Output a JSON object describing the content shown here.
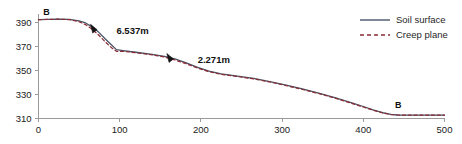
{
  "chart_data": {
    "type": "line",
    "title": "",
    "xlabel": "",
    "ylabel": "",
    "xlim": [
      0,
      500
    ],
    "ylim": [
      305,
      397
    ],
    "xticks": [
      0,
      100,
      200,
      300,
      400,
      500
    ],
    "yticks": [
      310,
      330,
      350,
      370,
      390
    ],
    "grid": false,
    "legend_position": "top-right",
    "series": [
      {
        "name": "Soil surface",
        "style": "solid",
        "color": "#4a5568",
        "points": [
          [
            0,
            392.4
          ],
          [
            12,
            392.6
          ],
          [
            25,
            392.8
          ],
          [
            38,
            392.6
          ],
          [
            50,
            391.4
          ],
          [
            58,
            389.6
          ],
          [
            66,
            386.4
          ],
          [
            74,
            382.0
          ],
          [
            82,
            376.4
          ],
          [
            90,
            371.2
          ],
          [
            96,
            367.4
          ],
          [
            104,
            366.6
          ],
          [
            120,
            365.2
          ],
          [
            140,
            363.4
          ],
          [
            155,
            361.8
          ],
          [
            168,
            359.6
          ],
          [
            182,
            356.4
          ],
          [
            196,
            352.6
          ],
          [
            210,
            349.4
          ],
          [
            225,
            347.2
          ],
          [
            245,
            345.4
          ],
          [
            265,
            343.4
          ],
          [
            285,
            340.8
          ],
          [
            305,
            337.8
          ],
          [
            325,
            334.6
          ],
          [
            345,
            331.2
          ],
          [
            365,
            327.4
          ],
          [
            385,
            323.2
          ],
          [
            400,
            320.0
          ],
          [
            412,
            317.2
          ],
          [
            424,
            314.8
          ],
          [
            434,
            313.4
          ],
          [
            442,
            312.9
          ],
          [
            460,
            312.8
          ],
          [
            480,
            312.8
          ],
          [
            500,
            312.8
          ]
        ]
      },
      {
        "name": "Creep plane",
        "style": "dashed",
        "color": "#8b2b33",
        "points": [
          [
            0,
            392.4
          ],
          [
            12,
            392.6
          ],
          [
            25,
            392.8
          ],
          [
            38,
            392.4
          ],
          [
            50,
            390.6
          ],
          [
            58,
            388.2
          ],
          [
            66,
            384.4
          ],
          [
            74,
            379.6
          ],
          [
            82,
            374.0
          ],
          [
            90,
            369.0
          ],
          [
            96,
            366.0
          ],
          [
            104,
            366.0
          ],
          [
            120,
            364.8
          ],
          [
            140,
            363.0
          ],
          [
            155,
            361.2
          ],
          [
            168,
            358.8
          ],
          [
            182,
            355.6
          ],
          [
            196,
            352.0
          ],
          [
            210,
            349.0
          ],
          [
            225,
            346.8
          ],
          [
            245,
            345.0
          ],
          [
            265,
            343.0
          ],
          [
            285,
            340.4
          ],
          [
            305,
            337.4
          ],
          [
            325,
            334.2
          ],
          [
            345,
            330.8
          ],
          [
            365,
            327.0
          ],
          [
            385,
            322.8
          ],
          [
            400,
            319.6
          ],
          [
            412,
            316.9
          ],
          [
            424,
            314.6
          ],
          [
            434,
            313.3
          ],
          [
            442,
            312.9
          ],
          [
            460,
            312.8
          ],
          [
            480,
            312.8
          ],
          [
            500,
            312.8
          ]
        ]
      }
    ],
    "annotations": [
      {
        "name": "displacement-1",
        "text": "6.537m",
        "marker": "arrow",
        "marker_x": 68,
        "marker_y": 385.0,
        "label_x": 96,
        "label_y": 383.0
      },
      {
        "name": "displacement-2",
        "text": "2.271m",
        "marker": "arrow",
        "marker_x": 162,
        "marker_y": 360.6,
        "label_x": 196,
        "label_y": 359.0
      }
    ],
    "point_labels": [
      {
        "name": "point-b-top",
        "text": "B",
        "x": 10,
        "y": 396.0
      },
      {
        "name": "point-b-bottom",
        "text": "B",
        "x": 443,
        "y": 318.5
      }
    ]
  },
  "legend": {
    "items": [
      {
        "label": "Soil surface",
        "style": "solid",
        "color": "#4a5568"
      },
      {
        "label": "Creep plane",
        "style": "dashed",
        "color": "#8b2b33"
      }
    ]
  }
}
